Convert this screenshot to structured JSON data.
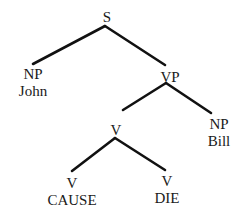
{
  "diagram": {
    "type": "syntax-tree",
    "nodes": [
      {
        "id": "s",
        "category": "S",
        "word": null,
        "x": 107,
        "y": 16
      },
      {
        "id": "np1",
        "category": "NP",
        "word": "John",
        "x": 33,
        "y": 73
      },
      {
        "id": "vp",
        "category": "VP",
        "word": null,
        "x": 169,
        "y": 76
      },
      {
        "id": "v",
        "category": "V",
        "word": null,
        "x": 116,
        "y": 129
      },
      {
        "id": "np2",
        "category": "NP",
        "word": "Bill",
        "x": 218,
        "y": 124
      },
      {
        "id": "v1",
        "category": "V",
        "word": "CAUSE",
        "x": 71,
        "y": 182
      },
      {
        "id": "v2",
        "category": "V",
        "word": "DIE",
        "x": 166,
        "y": 180
      }
    ],
    "edges": [
      {
        "from": "s",
        "to": "np1",
        "x1": 105,
        "y1": 26,
        "x2": 33,
        "y2": 64
      },
      {
        "from": "s",
        "to": "vp",
        "x1": 105,
        "y1": 26,
        "x2": 165,
        "y2": 65
      },
      {
        "from": "vp",
        "to": "v",
        "x1": 166,
        "y1": 83,
        "x2": 123,
        "y2": 110
      },
      {
        "from": "vp",
        "to": "np2",
        "x1": 166,
        "y1": 83,
        "x2": 211,
        "y2": 113
      },
      {
        "from": "v",
        "to": "v1",
        "x1": 115,
        "y1": 138,
        "x2": 72,
        "y2": 171
      },
      {
        "from": "v",
        "to": "v2",
        "x1": 115,
        "y1": 138,
        "x2": 165,
        "y2": 170
      }
    ],
    "labels": {
      "s": "S",
      "np1": "NP",
      "np1_word": "John",
      "vp": "VP",
      "v": "V",
      "np2": "NP",
      "np2_word": "Bill",
      "v1": "V",
      "v1_word": "CAUSE",
      "v2": "V",
      "v2_word": "DIE"
    },
    "colors": {
      "line": "#111111",
      "text": "#1a1a1a",
      "background": "#ffffff"
    }
  }
}
